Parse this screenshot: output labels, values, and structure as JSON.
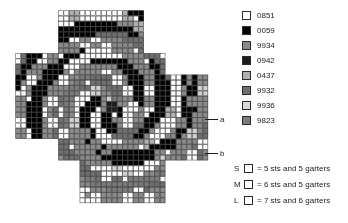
{
  "chart_data": {
    "type": "heatmap",
    "title": "",
    "xlabel": "",
    "ylabel": "",
    "cell_size": 5.35,
    "origin": {
      "x": 15.5,
      "y": 10.5
    },
    "cols": 36,
    "rows": 36,
    "grid_line_color": "#3c3c3c",
    "background": "#ffffff",
    "palette_keys": [
      "0851",
      "0059",
      "9934",
      "0942",
      "0437",
      "9932",
      "9936",
      "9823"
    ],
    "palette_colors": {
      "0851": "#ffffff",
      "0059": "#000000",
      "9934": "#8a8a8a",
      "0942": "#1c1c1c",
      "0437": "#b0b0b0",
      "9932": "#6e6e6e",
      "9936": "#d0d0d0",
      "9823": "#7a7a7a"
    },
    "empty_key": null,
    "legend_position": "right",
    "grid": [
      "............0059003700370085008500850059005900590085008500850059005900590085.....",
      "..........99349934993400850085005900590059993499340085008500590059005900850085...",
      "..........993499340085008500850059005900599934993400850085008500590059005900850085",
      "..........99349934993499340085008500850059005900599934993400850085008500590059",
      "..........9934993499349934993400850085008500590059005999340085008500850059",
      ".....00590059005900590059993499349934993400850085008500590059005999340085",
      "0059005900590059005900590059993499349934993400850085008500850059005999340085",
      "0059005900590059005900590059005999349934993499340085008500850085005900599934",
      "00850085008500850059005900590059993499349934993400850085008500850059005999340085",
      "00850085008500850085005900590059993499349934993499340085008500850085005999349934",
      "09420942008500850085008500850059005999349934993499340085008500850085009934",
      "09420942008500850085008500850085005900599934993499340942094200850085009934",
      "0437043700850085008500850085008500850059005999349934993400850085008500859934",
      "00850085008500850085008500850085008500850059005999349934993400850085008599349934",
      "99369936008500850085008500850085008500850085005900599934993499340085008500859934",
      "00850085008500850085008500850085008500850085008500590059005999349934993400859823",
      "99349934993499340085008500850085008500850085008500850059005900599934993499349823"
    ],
    "grid_note": "visual pattern approximated programmatically"
  },
  "chart": {
    "markers": [
      {
        "id": "a",
        "label": "a"
      },
      {
        "id": "b",
        "label": "b"
      }
    ]
  },
  "color_legend": {
    "items": [
      {
        "code": "0851",
        "color": "#ffffff",
        "swatch_name": "legend-swatch-0851"
      },
      {
        "code": "0059",
        "color": "#000000",
        "swatch_name": "legend-swatch-0059"
      },
      {
        "code": "9934",
        "color": "#8a8a8a",
        "swatch_name": "legend-swatch-9934"
      },
      {
        "code": "0942",
        "color": "#1c1c1c",
        "swatch_name": "legend-swatch-0942"
      },
      {
        "code": "0437",
        "color": "#b0b0b0",
        "swatch_name": "legend-swatch-0437"
      },
      {
        "code": "9932",
        "color": "#6e6e6e",
        "swatch_name": "legend-swatch-9932"
      },
      {
        "code": "9936",
        "color": "#d8d8d8",
        "swatch_name": "legend-swatch-9936"
      },
      {
        "code": "9823",
        "color": "#7a7a7a",
        "swatch_name": "legend-swatch-9823"
      }
    ]
  },
  "size_legend": {
    "rows": [
      {
        "code": "S",
        "text": "= 5 sts and 5 garters"
      },
      {
        "code": "M",
        "text": "= 6 sts and 5 garters"
      },
      {
        "code": "L",
        "text": "= 7 sts and 6 garters"
      }
    ]
  }
}
